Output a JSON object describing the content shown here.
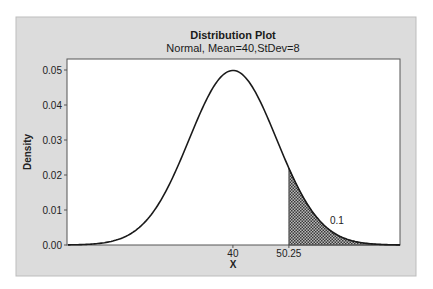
{
  "chart_data": {
    "type": "area",
    "title": "Distribution Plot",
    "subtitle": "Normal, Mean=40,StDev=8",
    "distribution": "normal",
    "mean": 40,
    "stdev": 8,
    "xlabel": "X",
    "ylabel": "Density",
    "xlim": [
      9.8,
      70.6
    ],
    "ylim": [
      0.0,
      0.05
    ],
    "x_ticks": [
      {
        "value": 40,
        "label": "40"
      },
      {
        "value": 50.25,
        "label": "50.25"
      }
    ],
    "y_ticks": [
      {
        "value": 0.0,
        "label": "0.00"
      },
      {
        "value": 0.01,
        "label": "0.01"
      },
      {
        "value": 0.02,
        "label": "0.02"
      },
      {
        "value": 0.03,
        "label": "0.03"
      },
      {
        "value": 0.04,
        "label": "0.04"
      },
      {
        "value": 0.05,
        "label": "0.05"
      }
    ],
    "shaded_region": {
      "from": 50.25,
      "to": 70.6,
      "area_label": "0.1",
      "tail": "right"
    },
    "peak_density": 0.0499,
    "grid": false,
    "legend": null
  },
  "colors": {
    "frame_bg": "#dcdcdc",
    "plot_bg": "#ffffff",
    "curve": "#1a1a1a",
    "shade": "#555555"
  }
}
